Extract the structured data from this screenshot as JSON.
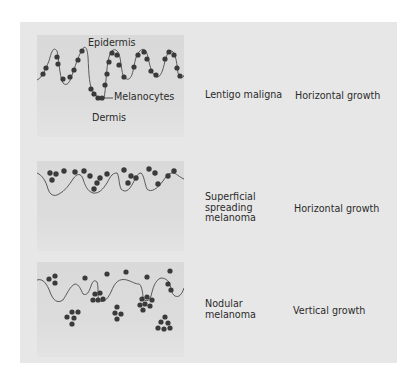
{
  "figure": {
    "panels": [
      {
        "id": "lentigo-maligna",
        "diagram_labels": {
          "top": "Epidermis",
          "pointer": "Melanocytes",
          "bottom": "Dermis"
        },
        "type_label": [
          "Lentigo maligna"
        ],
        "growth_label": "Horizontal growth"
      },
      {
        "id": "superficial-spreading",
        "type_label": [
          "Superficial",
          "spreading",
          "melanoma"
        ],
        "growth_label": "Horizontal growth"
      },
      {
        "id": "nodular",
        "type_label": [
          "Nodular",
          "melanoma"
        ],
        "growth_label": "Vertical growth"
      }
    ],
    "colors": {
      "page_background": "#ffffff",
      "panel_background": "#e7e7e7",
      "inner_box": "#d9d9d9",
      "melanocyte_dot": "#3a3a3a",
      "text": "#2b2b2b"
    }
  }
}
